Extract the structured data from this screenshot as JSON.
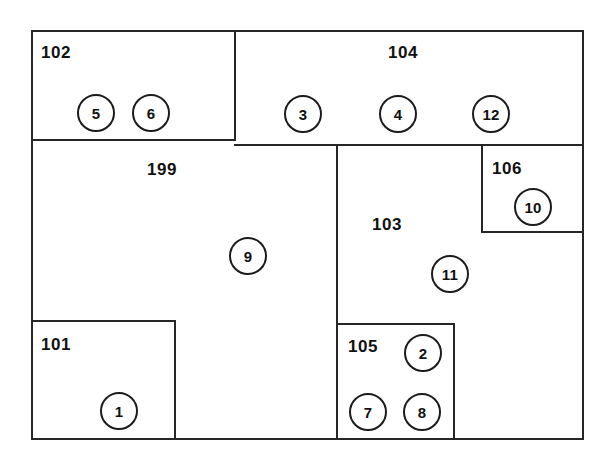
{
  "diagram": {
    "type": "block-partition-diagram",
    "canvas": {
      "width": 610,
      "height": 461,
      "background": "#ffffff"
    },
    "stroke_color": "#262626",
    "outer_boundary": {
      "x": 31,
      "y": 30,
      "width": 553,
      "height": 410
    },
    "regions": [
      {
        "id": "102",
        "label": "102",
        "x": 31,
        "y": 30,
        "width": 203,
        "height": 111,
        "label_x": 41,
        "label_y": 44
      },
      {
        "id": "104",
        "label": "104",
        "x": 234,
        "y": 30,
        "width": 350,
        "height": 116,
        "label_x": 388,
        "label_y": 44
      },
      {
        "id": "199",
        "label": "199",
        "x": 31,
        "y": 141,
        "width": 305,
        "height": 299,
        "label_x": 147,
        "label_y": 161
      },
      {
        "id": "103",
        "label": "103",
        "x": 336,
        "y": 146,
        "width": 248,
        "height": 294,
        "label_x": 372,
        "label_y": 216
      },
      {
        "id": "106",
        "label": "106",
        "x": 481,
        "y": 146,
        "width": 103,
        "height": 87,
        "label_x": 492,
        "label_y": 160
      },
      {
        "id": "101",
        "label": "101",
        "x": 31,
        "y": 320,
        "width": 145,
        "height": 120,
        "label_x": 41,
        "label_y": 336
      },
      {
        "id": "105",
        "label": "105",
        "x": 336,
        "y": 323,
        "width": 119,
        "height": 117,
        "label_x": 348,
        "label_y": 338
      }
    ],
    "nodes": [
      {
        "id": "5",
        "label": "5",
        "cx": 96,
        "cy": 113,
        "r": 19,
        "parent": "102"
      },
      {
        "id": "6",
        "label": "6",
        "cx": 151,
        "cy": 113,
        "r": 19,
        "parent": "102"
      },
      {
        "id": "3",
        "label": "3",
        "cx": 303,
        "cy": 114,
        "r": 19,
        "parent": "104"
      },
      {
        "id": "4",
        "label": "4",
        "cx": 398,
        "cy": 114,
        "r": 19,
        "parent": "104"
      },
      {
        "id": "12",
        "label": "12",
        "cx": 491,
        "cy": 114,
        "r": 19,
        "parent": "104"
      },
      {
        "id": "10",
        "label": "10",
        "cx": 533,
        "cy": 207,
        "r": 19,
        "parent": "106"
      },
      {
        "id": "9",
        "label": "9",
        "cx": 248,
        "cy": 256,
        "r": 19,
        "parent": "199"
      },
      {
        "id": "11",
        "label": "11",
        "cx": 450,
        "cy": 274,
        "r": 19,
        "parent": "103"
      },
      {
        "id": "2",
        "label": "2",
        "cx": 423,
        "cy": 353,
        "r": 19,
        "parent": "105"
      },
      {
        "id": "7",
        "label": "7",
        "cx": 368,
        "cy": 412,
        "r": 19,
        "parent": "105"
      },
      {
        "id": "8",
        "label": "8",
        "cx": 422,
        "cy": 412,
        "r": 19,
        "parent": "105"
      },
      {
        "id": "1",
        "label": "1",
        "cx": 119,
        "cy": 411,
        "r": 19,
        "parent": "101"
      }
    ]
  }
}
